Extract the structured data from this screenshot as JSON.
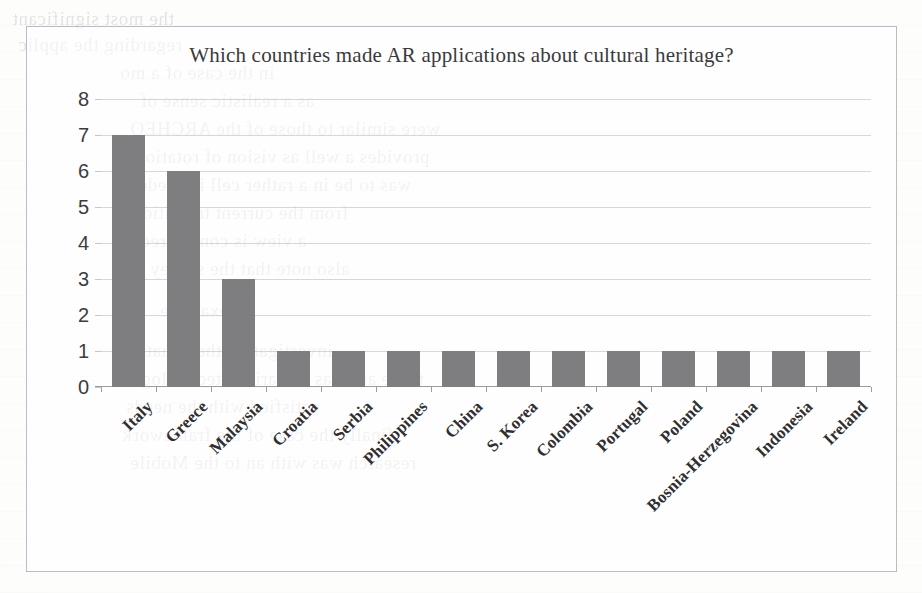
{
  "chart_data": {
    "type": "bar",
    "title": "Which countries made AR applications about cultural heritage?",
    "xlabel": "",
    "ylabel": "",
    "categories": [
      "Italy",
      "Greece",
      "Malaysia",
      "Croatia",
      "Serbia",
      "Philippines",
      "China",
      "S. Korea",
      "Colombia",
      "Portugal",
      "Poland",
      "Bosnia-Herzegovina",
      "Indonesia",
      "Ireland"
    ],
    "values": [
      7,
      6,
      3,
      1,
      1,
      1,
      1,
      1,
      1,
      1,
      1,
      1,
      1,
      1
    ],
    "ylim": [
      0,
      8
    ],
    "ytick_labels": [
      "0",
      "1",
      "2",
      "3",
      "4",
      "5",
      "6",
      "7",
      "8"
    ],
    "ytick_values": [
      0,
      1,
      2,
      3,
      4,
      5,
      6,
      7,
      8
    ],
    "grid": true,
    "legend": false,
    "legend_position": "none",
    "bar_color": "#7e7e80",
    "series_name": "Number of AR applications"
  },
  "figure": {
    "border_color": "#b9bcc2",
    "background_color": "#fdfdfc",
    "axis_color": "#9a9ca2",
    "grid_color": "#96989e",
    "title_color": "#3a3a3c",
    "tick_label_color": "#2f2f31"
  }
}
